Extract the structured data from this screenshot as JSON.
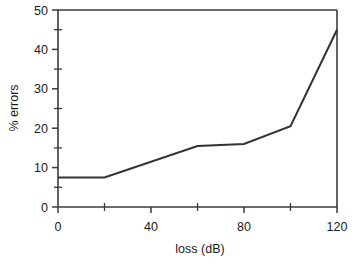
{
  "chart_data": {
    "type": "line",
    "title": "",
    "xlabel": "loss (dB)",
    "ylabel": "% errors",
    "x": [
      0,
      20,
      60,
      80,
      100,
      120
    ],
    "values": [
      7.5,
      7.5,
      15.5,
      16,
      20.5,
      45
    ],
    "series": [
      {
        "name": "% errors",
        "x": [
          0,
          20,
          60,
          80,
          100,
          120
        ],
        "values": [
          7.5,
          7.5,
          15.5,
          16,
          20.5,
          45
        ]
      }
    ],
    "xlim": [
      0,
      120
    ],
    "ylim": [
      0,
      50
    ],
    "x_ticks_major": [
      0,
      40,
      80,
      120
    ],
    "x_ticks_minor": [
      20,
      60,
      100
    ],
    "y_ticks_major": [
      0,
      10,
      20,
      30,
      40,
      50
    ],
    "y_ticks_minor": [
      5,
      15,
      25,
      35,
      45
    ],
    "x_tick_labels": [
      "0",
      "40",
      "80",
      "120"
    ],
    "y_tick_labels": [
      "0",
      "10",
      "20",
      "30",
      "40",
      "50"
    ],
    "grid": false,
    "legend": "none",
    "line_color": "#333333",
    "axis_color": "#3b3b3b",
    "background": "#ffffff"
  },
  "axes": {
    "x_label": "loss (dB)",
    "y_label": "% errors",
    "x_ticks": [
      {
        "value": 0,
        "label": "0"
      },
      {
        "value": 40,
        "label": "40"
      },
      {
        "value": 80,
        "label": "80"
      },
      {
        "value": 120,
        "label": "120"
      }
    ],
    "y_ticks": [
      {
        "value": 0,
        "label": "0"
      },
      {
        "value": 10,
        "label": "10"
      },
      {
        "value": 20,
        "label": "20"
      },
      {
        "value": 30,
        "label": "30"
      },
      {
        "value": 40,
        "label": "40"
      },
      {
        "value": 50,
        "label": "50"
      }
    ]
  }
}
